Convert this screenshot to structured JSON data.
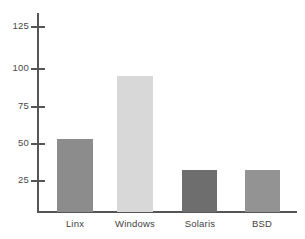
{
  "chart_data": {
    "type": "bar",
    "title": "",
    "subtitle": "",
    "xlabel": "",
    "ylabel": "",
    "categories": [
      "Linx",
      "Windows",
      "Solaris",
      "BSD"
    ],
    "values": [
      54,
      96,
      33,
      33
    ],
    "series": [
      {
        "name": "Installations",
        "values": [
          54,
          96,
          33,
          33
        ]
      }
    ],
    "bar_colors": [
      "#8c8c8c",
      "#d8d8d8",
      "#6e6e6e",
      "#939393"
    ],
    "ylim": [
      5,
      133
    ],
    "yticks": [
      25,
      50,
      75,
      100,
      125
    ],
    "ytick_labels": [
      "25",
      "50",
      "75",
      "100",
      "125"
    ],
    "xticks": [
      "Linx",
      "Windows",
      "Solaris",
      "BSD"
    ],
    "grid": false,
    "legend": false,
    "legend_position": "none",
    "axis_color": "#555555",
    "background_color": "#ffffff",
    "text_color": "#3f3f3f"
  }
}
